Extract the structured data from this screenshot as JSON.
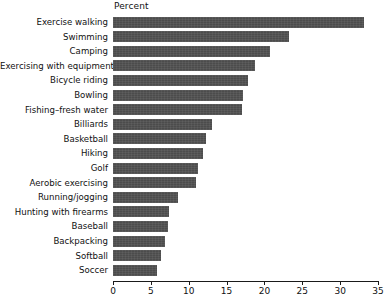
{
  "chart_data": {
    "type": "bar",
    "orientation": "horizontal",
    "title": "Percent",
    "xlabel": "Percent",
    "ylabel": "",
    "xlim": [
      0,
      35
    ],
    "xticks": [
      0,
      5,
      10,
      15,
      20,
      25,
      30,
      35
    ],
    "grid": false,
    "legend": null,
    "bar_color": "#4c4c4c",
    "categories": [
      "Exercise walking",
      "Swimming",
      "Camping",
      "Exercising with equipment",
      "Bicycle riding",
      "Bowling",
      "Fishing–fresh water",
      "Billiards",
      "Basketball",
      "Hiking",
      "Golf",
      "Aerobic exercising",
      "Running/jogging",
      "Hunting with firearms",
      "Baseball",
      "Backpacking",
      "Softball",
      "Soccer"
    ],
    "values": [
      33.2,
      23.2,
      20.7,
      18.8,
      17.8,
      17.2,
      17.1,
      13.1,
      12.3,
      11.9,
      11.2,
      10.9,
      8.6,
      7.4,
      7.3,
      6.9,
      6.3,
      5.8
    ]
  }
}
